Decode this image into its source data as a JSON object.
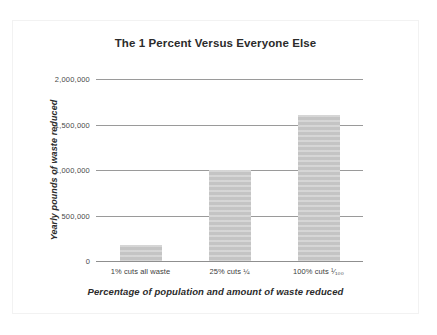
{
  "chart_data": {
    "type": "bar",
    "title": "The 1 Percent Versus Everyone Else",
    "xlabel": "Percentage of population and amount of waste reduced",
    "ylabel": "Yearly pounds of waste reduced",
    "categories": [
      "1% cuts all waste",
      "25% cuts ¼",
      "100% cuts ¹⁄₁₀₀"
    ],
    "values": [
      180000,
      1000000,
      1610000
    ],
    "ylim": [
      0,
      2000000
    ],
    "yticks": [
      0,
      500000,
      1000000,
      1500000,
      2000000
    ],
    "ytick_labels": [
      "0",
      "500,000",
      "1,000,000",
      "1,500,000",
      "2,000,000"
    ],
    "grid": true,
    "legend": false,
    "bar_color": "#c4c4c4",
    "grid_color": "#9a9a9a",
    "text_color": "#2b2b2b"
  }
}
